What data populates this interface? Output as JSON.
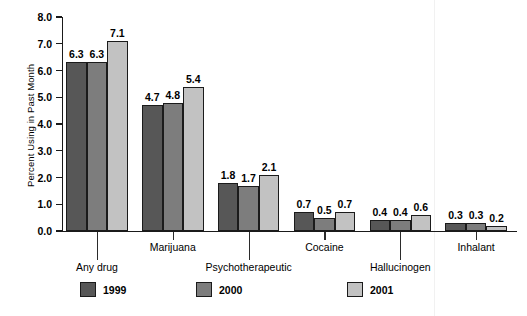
{
  "chart_data": {
    "type": "bar",
    "title": "",
    "subtitle": "",
    "xlabel": "",
    "ylabel": "Percent Using in Past Month",
    "ylim": [
      0.0,
      8.0
    ],
    "ytick_step": 1.0,
    "ytick_labels": [
      "0.0",
      "1.0",
      "2.0",
      "3.0",
      "4.0",
      "5.0",
      "6.0",
      "7.0",
      "8.0"
    ],
    "grid": false,
    "legend_position": "bottom",
    "categories": [
      "Any drug",
      "Marijuana",
      "Psychotherapeutic",
      "Cocaine",
      "Hallucinogen",
      "Inhalant"
    ],
    "series": [
      {
        "name": "1999",
        "color": "#575757",
        "values": [
          6.3,
          4.7,
          1.8,
          0.7,
          0.4,
          0.3
        ]
      },
      {
        "name": "2000",
        "color": "#7d7d7d",
        "values": [
          6.3,
          4.8,
          1.7,
          0.5,
          0.4,
          0.3
        ]
      },
      {
        "name": "2001",
        "color": "#c2c2c2",
        "values": [
          7.1,
          5.4,
          2.1,
          0.7,
          0.6,
          0.2
        ]
      }
    ],
    "bar_value_labels": [
      [
        "6.3",
        "6.3",
        "7.1"
      ],
      [
        "4.7",
        "4.8",
        "5.4"
      ],
      [
        "1.8",
        "1.7",
        "2.1"
      ],
      [
        "0.7",
        "0.5",
        "0.7"
      ],
      [
        "0.4",
        "0.4",
        "0.6"
      ],
      [
        "0.3",
        "0.3",
        "0.2"
      ]
    ]
  },
  "legend": {
    "entries": [
      {
        "label": "1999",
        "color": "#575757"
      },
      {
        "label": "2000",
        "color": "#7d7d7d"
      },
      {
        "label": "2001",
        "color": "#c2c2c2"
      }
    ]
  }
}
